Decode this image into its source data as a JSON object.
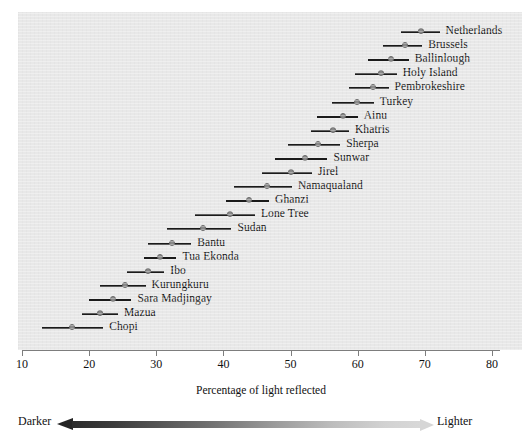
{
  "chart_data": {
    "type": "scatter",
    "title": "",
    "xlabel": "Percentage of light reflected",
    "ylabel": "",
    "xlim": [
      10,
      80
    ],
    "xticks": [
      10,
      20,
      30,
      40,
      50,
      60,
      70,
      80
    ],
    "xtick_labels": [
      "10",
      "20",
      "30",
      "40",
      "50",
      "60",
      "70",
      "80"
    ],
    "grid": false,
    "legend": "none",
    "orientation": "horizontal",
    "note": "Dot = mean percentage of light reflected from skin; horizontal bar = range/interval.",
    "categories": [
      "Netherlands",
      "Brussels",
      "Ballinlough",
      "Holy Island",
      "Pembrokeshire",
      "Turkey",
      "Ainu",
      "Khatris",
      "Sherpa",
      "Sunwar",
      "Jirel",
      "Namaqualand",
      "Ghanzi",
      "Lone Tree",
      "Sudan",
      "Bantu",
      "Tua Ekonda",
      "Ibo",
      "Kurungkuru",
      "Sara Madjingay",
      "Mazua",
      "Chopi"
    ],
    "points": [
      {
        "label": "Netherlands",
        "value": 69.5,
        "low": 66.5,
        "high": 72.2
      },
      {
        "label": "Brussels",
        "value": 67.0,
        "low": 63.8,
        "high": 69.6
      },
      {
        "label": "Ballinlough",
        "value": 65.0,
        "low": 61.5,
        "high": 67.6
      },
      {
        "label": "Holy Island",
        "value": 63.4,
        "low": 59.6,
        "high": 65.8
      },
      {
        "label": "Pembrokeshire",
        "value": 62.3,
        "low": 58.7,
        "high": 64.6
      },
      {
        "label": "Turkey",
        "value": 59.9,
        "low": 56.2,
        "high": 62.4
      },
      {
        "label": "Ainu",
        "value": 57.8,
        "low": 54.0,
        "high": 60.0
      },
      {
        "label": "Khatris",
        "value": 56.3,
        "low": 53.0,
        "high": 58.7
      },
      {
        "label": "Sherpa",
        "value": 54.1,
        "low": 49.6,
        "high": 57.4
      },
      {
        "label": "Sunwar",
        "value": 52.1,
        "low": 47.7,
        "high": 55.5
      },
      {
        "label": "Jirel",
        "value": 50.0,
        "low": 45.8,
        "high": 53.2
      },
      {
        "label": "Namaqualand",
        "value": 46.5,
        "low": 41.6,
        "high": 50.2
      },
      {
        "label": "Ghanzi",
        "value": 43.8,
        "low": 40.4,
        "high": 46.8
      },
      {
        "label": "Lone Tree",
        "value": 41.0,
        "low": 35.8,
        "high": 44.7
      },
      {
        "label": "Sudan",
        "value": 36.9,
        "low": 31.6,
        "high": 41.2
      },
      {
        "label": "Bantu",
        "value": 32.3,
        "low": 28.8,
        "high": 35.2
      },
      {
        "label": "Tua Ekonda",
        "value": 30.5,
        "low": 28.1,
        "high": 33.0
      },
      {
        "label": "Ibo",
        "value": 28.8,
        "low": 25.7,
        "high": 31.2
      },
      {
        "label": "Kurungkuru",
        "value": 25.3,
        "low": 21.6,
        "high": 28.4
      },
      {
        "label": "Sara Madjingay",
        "value": 23.5,
        "low": 20.0,
        "high": 26.3
      },
      {
        "label": "Mazua",
        "value": 21.6,
        "low": 18.9,
        "high": 24.3
      },
      {
        "label": "Chopi",
        "value": 17.5,
        "low": 13.0,
        "high": 22.1
      }
    ]
  },
  "legend_scale": {
    "left_label": "Darker",
    "right_label": "Lighter",
    "left_color": "#242424",
    "right_color": "#d6d6d6"
  },
  "colors": {
    "panel_background": "#e8e8e8",
    "page_background": "#ffffff",
    "line": "#1a1a1a",
    "marker": "#8a8a8a",
    "axis": "#7d7d7d",
    "text": "#111111"
  },
  "layout": {
    "plot_left_px": 18,
    "plot_top_px": 12,
    "plot_width_px": 504,
    "plot_height_px": 338,
    "axis_origin_x_px": 22,
    "px_per_unit": 6.714,
    "first_row_y_px": 32,
    "row_spacing_px": 14.1
  }
}
